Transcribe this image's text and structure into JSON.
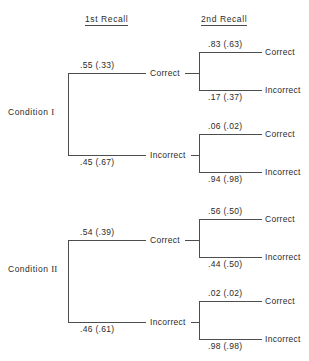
{
  "figure": {
    "type": "probability-tree-diagram",
    "background": "#ffffff",
    "line_color": "#4d4d4d",
    "text_color": "#2b2b2b"
  },
  "headers": {
    "first_recall": "1st  Recall",
    "second_recall": "2nd  Recall"
  },
  "conditions": [
    {
      "label_prefix": "Condition",
      "label_numeral": "I",
      "branches": [
        {
          "probability": ".55 (.33)",
          "node_label": "Correct",
          "leaves": [
            {
              "probability": ".83 (.63)",
              "label": "Correct"
            },
            {
              "probability": ".17 (.37)",
              "label": "Incorrect"
            }
          ]
        },
        {
          "probability": ".45 (.67)",
          "node_label": "Incorrect",
          "leaves": [
            {
              "probability": ".06 (.02)",
              "label": "Correct"
            },
            {
              "probability": ".94 (.98)",
              "label": "Incorrect"
            }
          ]
        }
      ]
    },
    {
      "label_prefix": "Condition",
      "label_numeral": "II",
      "branches": [
        {
          "probability": ".54 (.39)",
          "node_label": "Correct",
          "leaves": [
            {
              "probability": ".56 (.50)",
              "label": "Correct"
            },
            {
              "probability": ".44 (.50)",
              "label": "Incorrect"
            }
          ]
        },
        {
          "probability": ".46 (.61)",
          "node_label": "Incorrect",
          "leaves": [
            {
              "probability": ".02 (.02)",
              "label": "Correct"
            },
            {
              "probability": ".98 (.98)",
              "label": "Incorrect"
            }
          ]
        }
      ]
    }
  ]
}
